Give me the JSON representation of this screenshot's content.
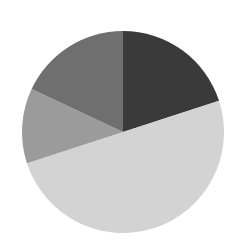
{
  "chart_data": {
    "type": "pie",
    "title": "",
    "legend": "none",
    "start_angle_deg": 0,
    "direction": "clockwise",
    "slices": [
      {
        "label": "",
        "value": 20,
        "color": "#3a3a3a"
      },
      {
        "label": "",
        "value": 50,
        "color": "#d3d3d3"
      },
      {
        "label": "",
        "value": 12,
        "color": "#9b9b9b"
      },
      {
        "label": "",
        "value": 18,
        "color": "#6f6f6f"
      }
    ],
    "values": [
      20,
      50,
      12,
      18
    ]
  },
  "layout": {
    "cx": 123,
    "cy": 132,
    "r": 101
  }
}
